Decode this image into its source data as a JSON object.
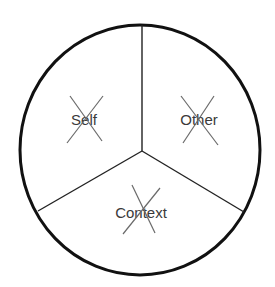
{
  "diagram": {
    "type": "circle-divided-into-three-segments",
    "segments": [
      {
        "id": "self",
        "label": "Self",
        "crossed_out": true,
        "position": "upper-left"
      },
      {
        "id": "other",
        "label": "Other",
        "crossed_out": true,
        "position": "upper-right"
      },
      {
        "id": "context",
        "label": "Context",
        "crossed_out": true,
        "position": "bottom"
      }
    ],
    "colors": {
      "outline": "#111111",
      "spokes": "#222222",
      "text": "#3a3a3a",
      "cross_marks": "#6a6a6a",
      "background": "#ffffff"
    }
  }
}
